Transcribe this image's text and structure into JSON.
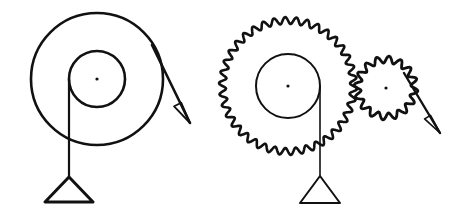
{
  "document": {
    "title": "Pulley and Gear Mechanism Diagram",
    "kind": "line-drawing",
    "background_color": "#ffffff",
    "ink_color": "#111111",
    "width": 463,
    "height": 216
  },
  "figures": [
    {
      "id": "smooth-pulley-assembly",
      "label": "Smooth pulley with hanging weight",
      "outer_wheel": {
        "name": "outer-rim-circle",
        "cx": 97,
        "cy": 79,
        "r": 66,
        "stroke_width": 2.6
      },
      "inner_wheel": {
        "name": "inner-hub-circle",
        "cx": 97,
        "cy": 79,
        "r": 28,
        "stroke_width": 2.6
      },
      "axle_dot": {
        "name": "axle-center-dot",
        "cx": 97,
        "cy": 79,
        "r": 1.6
      },
      "string": {
        "name": "hanging-string",
        "x": 69,
        "y_top": 79,
        "y_bottom": 177,
        "stroke_width": 2.2
      },
      "weight": {
        "name": "triangular-weight",
        "apex_x": 69,
        "apex_y": 177,
        "left_x": 45,
        "right_x": 93,
        "base_y": 202,
        "stroke_width": 3.0
      },
      "force_arrow": {
        "name": "tangent-force-arrow",
        "x1": 152,
        "y1": 45,
        "x2": 190,
        "y2": 123,
        "head_length": 22,
        "head_width": 7,
        "stroke_width": 2.6
      }
    },
    {
      "id": "geared-pulley-assembly",
      "label": "Toothed gear wheel with hanging weight driving a pinion",
      "drive_gear": {
        "name": "large-gear",
        "cx": 288,
        "cy": 86,
        "outer_r": 69,
        "root_r": 62,
        "teeth": 38,
        "stroke_width": 2.6
      },
      "drive_hub": {
        "name": "large-gear-hub-circle",
        "cx": 288,
        "cy": 86,
        "r": 32,
        "stroke_width": 2.0
      },
      "drive_axle_dot": {
        "name": "large-gear-axle-dot",
        "cx": 288,
        "cy": 86,
        "r": 1.6
      },
      "string": {
        "name": "hanging-string",
        "x": 320,
        "y_top": 86,
        "y_bottom": 176,
        "stroke_width": 1.6
      },
      "weight": {
        "name": "triangular-weight",
        "apex_x": 320,
        "apex_y": 176,
        "left_x": 300,
        "right_x": 340,
        "base_y": 203,
        "stroke_width": 2.0
      },
      "pinion_gear": {
        "name": "small-gear",
        "cx": 386,
        "cy": 88,
        "outer_r": 32,
        "root_r": 25,
        "teeth": 16,
        "stroke_width": 2.8
      },
      "pinion_axle_dot": {
        "name": "small-gear-axle-dot",
        "cx": 386,
        "cy": 88,
        "r": 1.6
      },
      "force_arrow": {
        "name": "tangent-force-arrow",
        "x1": 404,
        "y1": 73,
        "x2": 440,
        "y2": 133,
        "head_length": 20,
        "head_width": 6,
        "stroke_width": 2.4
      }
    }
  ]
}
